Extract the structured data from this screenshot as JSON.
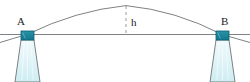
{
  "figure": {
    "name": "suspension-bridge-cable-sag-diagram",
    "type": "physics-diagram",
    "labels": {
      "point_a": "A",
      "point_b": "B",
      "sag_height": "h"
    },
    "colors": {
      "cable_stroke": "#6f7476",
      "deck_line": "#6f7476",
      "pylon_outline": "#6f7476",
      "pylon_fill_top": "#e8f7fa",
      "pylon_fill_bottom": "#cfeef3",
      "cap_fill": "#1b8296",
      "cap_outline": "#0d5f70",
      "dashed_stroke": "#8a8f91",
      "label_color": "#1a1a1a",
      "background": "#ffffff"
    },
    "geometry": {
      "width": 250,
      "height": 82,
      "deck_line_y": 34.5,
      "deck_line_x_start": 0,
      "deck_line_x_end": 250,
      "anchor_a_x": 27,
      "anchor_a_y": 34.5,
      "anchor_b_x": 222,
      "anchor_b_y": 34.5,
      "cable_apex_x": 126,
      "cable_apex_y": 5.5,
      "cable_overhang_left_x": 0,
      "cable_overhang_left_y": 42,
      "cable_overhang_right_x": 250,
      "cable_overhang_right_y": 42,
      "dashed_line_x": 126,
      "dashed_line_y_top": 6,
      "dashed_line_y_bottom": 34.5,
      "dash_pattern": "3 3",
      "pylon_left_top_left_x": 21,
      "pylon_left_top_right_x": 34,
      "pylon_left_bottom_left_x": 15,
      "pylon_left_bottom_right_x": 40,
      "pylon_right_top_left_x": 216,
      "pylon_right_top_right_x": 229,
      "pylon_right_bottom_left_x": 210,
      "pylon_right_bottom_right_x": 235,
      "pylon_top_y": 40,
      "pylon_bottom_y": 82,
      "cap_left_x": 21,
      "cap_right_x": 216,
      "cap_y": 31,
      "cap_width": 13,
      "cap_height": 9
    }
  }
}
